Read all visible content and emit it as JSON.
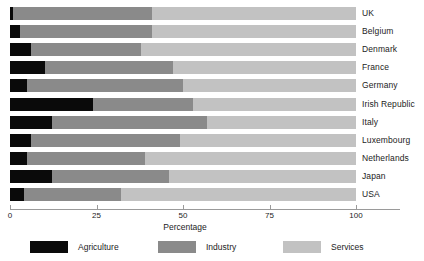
{
  "chart_data": {
    "type": "bar",
    "subtype": "stacked-horizontal-100",
    "title": "",
    "xlabel": "Percentage",
    "ylabel": "",
    "xlim": [
      0,
      100
    ],
    "xticks": [
      0,
      25,
      50,
      75,
      100
    ],
    "xticklabels": [
      "0",
      "25",
      "50",
      "75",
      "100"
    ],
    "grid": false,
    "legend_position": "bottom",
    "categories": [
      "UK",
      "Belgium",
      "Denmark",
      "France",
      "Germany",
      "Irish Republic",
      "Italy",
      "Luxembourg",
      "Netherlands",
      "Japan",
      "USA"
    ],
    "series": [
      {
        "name": "Agriculture",
        "color": "#0a0a0a",
        "values": [
          1,
          3,
          6,
          10,
          5,
          24,
          12,
          6,
          5,
          12,
          4
        ]
      },
      {
        "name": "Industry",
        "color": "#8a8a8a",
        "values": [
          40,
          38,
          32,
          37,
          45,
          29,
          45,
          43,
          34,
          34,
          28
        ]
      },
      {
        "name": "Services",
        "color": "#c2c2c2",
        "values": [
          59,
          59,
          62,
          53,
          50,
          47,
          43,
          51,
          61,
          54,
          68
        ]
      }
    ],
    "cumulative_boundaries": {
      "note": "end of agriculture / end of industry, in percent",
      "UK": [
        1,
        41
      ],
      "Belgium": [
        3,
        41
      ],
      "Denmark": [
        6,
        38
      ],
      "France": [
        10,
        47
      ],
      "Germany": [
        5,
        50
      ],
      "Irish Republic": [
        24,
        53
      ],
      "Italy": [
        12,
        57
      ],
      "Luxembourg": [
        6,
        49
      ],
      "Netherlands": [
        5,
        39
      ],
      "Japan": [
        12,
        46
      ],
      "USA": [
        4,
        32
      ]
    }
  },
  "legend": {
    "items": [
      {
        "label": "Agriculture",
        "color": "#0a0a0a"
      },
      {
        "label": "Industry",
        "color": "#8a8a8a"
      },
      {
        "label": "Services",
        "color": "#c2c2c2"
      }
    ]
  },
  "axis": {
    "title": "Percentage",
    "ticks": [
      "0",
      "25",
      "50",
      "75",
      "100"
    ]
  },
  "cropped_title": ""
}
